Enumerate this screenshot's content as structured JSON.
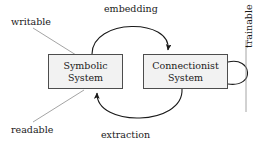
{
  "diagram": {
    "background_color": "#ffffff",
    "node_fill_color": "#f2f2f2",
    "node_border_color": "#4d4d4d",
    "edge_color": "#1a1a1a",
    "leader_color": "#9a9a9a",
    "text_color": "#1a1a1a",
    "nodes": [
      {
        "id": "symbolic",
        "line1": "Symbolic",
        "line2": "System"
      },
      {
        "id": "connectionist",
        "line1": "Connectionist",
        "line2": "System"
      }
    ],
    "edges": [
      {
        "id": "embedding",
        "label": "embedding",
        "from": "symbolic",
        "to": "connectionist",
        "style": "curved-arc-top"
      },
      {
        "id": "extraction",
        "label": "extraction",
        "from": "connectionist",
        "to": "symbolic",
        "style": "curved-arc-bottom"
      },
      {
        "id": "trainable",
        "label": "trainable",
        "from": "connectionist",
        "to": "connectionist",
        "style": "self-loop-right"
      }
    ],
    "annotations": [
      {
        "id": "writable",
        "label": "writable",
        "target": "symbolic",
        "style": "leader-line"
      },
      {
        "id": "readable",
        "label": "readable",
        "target": "symbolic",
        "style": "leader-line"
      }
    ]
  }
}
